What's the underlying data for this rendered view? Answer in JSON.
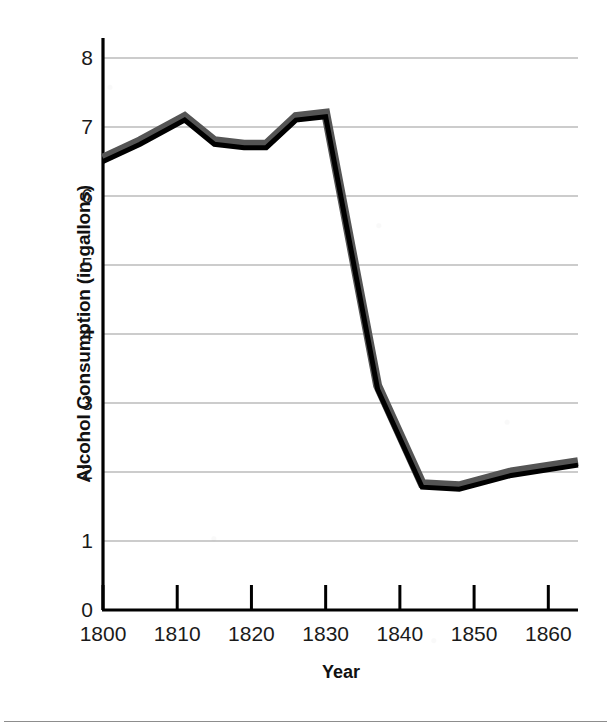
{
  "chart_data": {
    "type": "line",
    "title": "",
    "xlabel": "Year",
    "ylabel": "Alcohol Consumption (in gallons)",
    "xlim": [
      1800,
      1864
    ],
    "ylim": [
      0,
      8
    ],
    "xticks": [
      1800,
      1810,
      1820,
      1830,
      1840,
      1850,
      1860
    ],
    "xtick_labels": [
      "1800",
      "1810",
      "1820",
      "1830",
      "1840",
      "1850",
      "1860"
    ],
    "yticks": [
      0,
      1,
      2,
      3,
      4,
      5,
      6,
      7,
      8
    ],
    "ytick_labels": [
      "0",
      "1",
      "2",
      "3",
      "4",
      "5",
      "6",
      "7",
      "8"
    ],
    "grid": "horizontal",
    "legend": "none",
    "series": [
      {
        "name": "Alcohol Consumption",
        "line_color": "#000000",
        "shadow_color": "#555555",
        "x": [
          1800,
          1805,
          1811,
          1815,
          1819,
          1822,
          1826,
          1830,
          1837,
          1843,
          1848,
          1855,
          1864
        ],
        "values": [
          6.5,
          6.75,
          7.1,
          6.75,
          6.7,
          6.7,
          7.1,
          7.15,
          3.2,
          1.78,
          1.75,
          1.95,
          2.1
        ]
      }
    ]
  },
  "axes": {
    "y_title": "Alcohol Consumption (in gallons)",
    "x_title": "Year"
  },
  "colors": {
    "line": "#000000",
    "line_shadow": "#555555",
    "grid": "#9a9a9a",
    "axis": "#000000",
    "background": "#ffffff"
  }
}
